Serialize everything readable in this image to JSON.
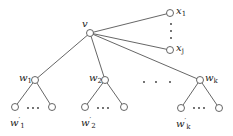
{
  "diagram": {
    "type": "tree",
    "root": {
      "id": "v",
      "label": "v"
    },
    "leaf_children_of_root": [
      {
        "id": "x1",
        "label": "x",
        "sub": "1"
      },
      {
        "id": "xj",
        "label": "x",
        "sub": "j"
      }
    ],
    "internal_children_of_root": [
      {
        "id": "w1",
        "label": "w",
        "sub": "1",
        "leaf_label": "w",
        "leaf_sup": "′",
        "leaf_sub": "1"
      },
      {
        "id": "w2",
        "label": "w",
        "sub": "2",
        "leaf_label": "w",
        "leaf_sup": "′",
        "leaf_sub": "2"
      },
      {
        "id": "wk",
        "label": "w",
        "sub": "k",
        "leaf_label": "w",
        "leaf_sup": "′",
        "leaf_sub": "k"
      }
    ],
    "ellipsis": "· · ·",
    "colors": {
      "line": "#555555",
      "node_fill": "#ffffff",
      "node_stroke": "#555555",
      "text": "#222222"
    }
  }
}
